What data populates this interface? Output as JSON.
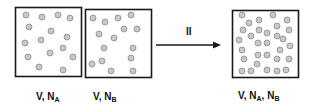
{
  "diagram": {
    "colors": {
      "box_stroke": "#1a1a1a",
      "particle_fill": "#c8c8c8",
      "particle_stroke": "#8a8a8a",
      "arrow": "#1a1a1a",
      "text": "#111111"
    },
    "boxes": [
      {
        "id": "A",
        "label": {
          "prefix": "V, N",
          "sub1": "A",
          "mid": "",
          "sub2": ""
        },
        "particle_count": 15
      },
      {
        "id": "B",
        "label": {
          "prefix": "V, N",
          "sub1": "B",
          "mid": "",
          "sub2": ""
        },
        "particle_count": 15
      },
      {
        "id": "mixed",
        "label": {
          "prefix": "V, N",
          "sub1": "A",
          "mid": ", N",
          "sub2": "B"
        },
        "particle_count": 34
      }
    ],
    "arrow": {
      "label": "II"
    }
  }
}
